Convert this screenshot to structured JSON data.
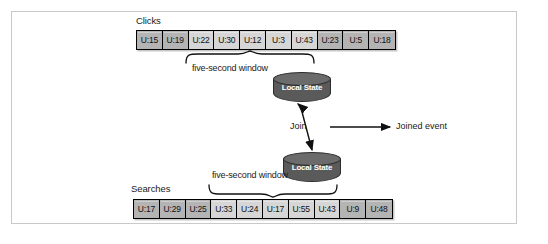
{
  "figure": {
    "title_alt": "Stream-stream join with five-second windows",
    "frame_color": "#c9c9c9",
    "background": "#ffffff"
  },
  "streams": [
    {
      "id": "clicks",
      "label": "Clicks",
      "events": [
        "U:15",
        "U:19",
        "U:22",
        "U:30",
        "U:12",
        "U:3",
        "U:43",
        "U:23",
        "U:5",
        "U:18"
      ],
      "window": {
        "caption": "five-second window",
        "start_index": 2,
        "end_index": 6,
        "cells": [
          "U:22",
          "U:30",
          "U:12",
          "U:3",
          "U:43"
        ]
      }
    },
    {
      "id": "searches",
      "label": "Searches",
      "events": [
        "U:17",
        "U:29",
        "U:25",
        "U:33",
        "U:24",
        "U:17",
        "U:55",
        "U:43",
        "U:9",
        "U:48"
      ],
      "window": {
        "caption": "five-second window",
        "start_index": 3,
        "end_index": 7,
        "cells": [
          "U:33",
          "U:24",
          "U:17",
          "U:55",
          "U:43"
        ]
      }
    }
  ],
  "stores": [
    {
      "id": "clicks-state",
      "label": "Local State"
    },
    {
      "id": "searches-state",
      "label": "Local State"
    }
  ],
  "connectors": {
    "join_label": "Join",
    "output_label": "Joined event"
  },
  "colors": {
    "cell_fill": "#b4b4b4",
    "cell_window_fill": "#d6d6d6",
    "cell_border": "#000000",
    "cylinder_body": "#5a5a5a",
    "cylinder_top": "#6b6b6b",
    "text": "#1a1a1a"
  }
}
